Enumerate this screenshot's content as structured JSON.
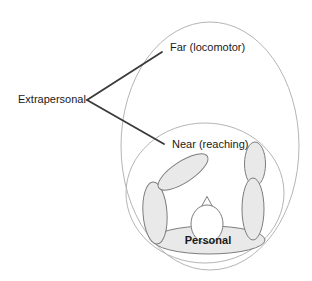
{
  "diagram": {
    "zones": [
      {
        "id": "far",
        "label": "Far (locomotor)"
      },
      {
        "id": "near",
        "label": "Near (reaching)"
      },
      {
        "id": "personal",
        "label": "Personal"
      }
    ],
    "annotation": {
      "label": "Extrapersonal",
      "connects_to": [
        "Far (locomotor)",
        "Near (reaching)"
      ]
    },
    "figure": "person-top-view-with-head-shoulders-and-arms",
    "colors": {
      "background": "#ffffff",
      "zone_outline": "#b5b5b5",
      "body_outline": "#7d7d7d",
      "body_fill": "#e9e9e9",
      "connector_line": "#3a3a3a",
      "text": "#1a1a1a"
    }
  }
}
